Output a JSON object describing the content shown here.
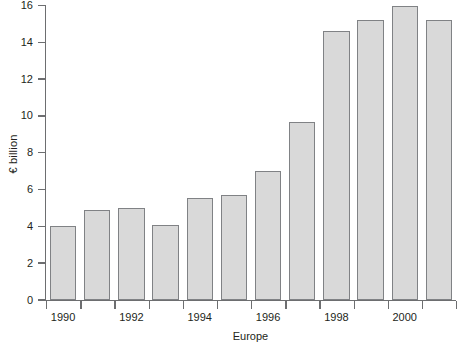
{
  "chart_data": {
    "type": "bar",
    "title": "",
    "xlabel": "Europe",
    "ylabel": "€ billion",
    "categories": [
      "1990",
      "1991",
      "1992",
      "1993",
      "1994",
      "1995",
      "1996",
      "1997",
      "1998",
      "1999",
      "2000",
      "2001"
    ],
    "values": [
      4.0,
      4.9,
      5.0,
      4.05,
      5.55,
      5.7,
      7.0,
      9.65,
      14.6,
      15.2,
      15.95,
      15.2
    ],
    "ylim": [
      0,
      16
    ],
    "ytick_values": [
      0,
      2,
      4,
      6,
      8,
      10,
      12,
      14,
      16
    ],
    "ytick_labels": [
      "0",
      "2",
      "4",
      "6",
      "8",
      "10",
      "12",
      "14",
      "16"
    ],
    "xtick_labels": [
      "1990",
      "",
      "1992",
      "",
      "1994",
      "",
      "1996",
      "",
      "1998",
      "",
      "2000",
      ""
    ],
    "visible_xtick_labels": [
      "1990",
      "1992",
      "1994",
      "1996",
      "1998",
      "2000"
    ],
    "grid": false,
    "legend": null,
    "bar_fill_color": "#d9d9d9",
    "bar_edge_color": "#808285",
    "axis_color": "#6d6e70",
    "text_color": "#231f20",
    "background_color": "#ffffff"
  }
}
